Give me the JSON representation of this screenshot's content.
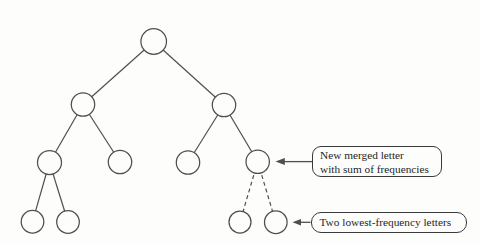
{
  "figure": {
    "background": "#fdfdfc",
    "line_color": "#4f4f4f",
    "node_fill": "#fdfdfc",
    "box_border_color": "#3a3a3a",
    "text_color": "#1f1f1f"
  },
  "tree": {
    "type": "binary-tree",
    "levels": 4,
    "node_count": 11,
    "nodes": [
      {
        "id": "root",
        "level": 0
      },
      {
        "id": "left",
        "level": 1,
        "parent": "root",
        "edge": "solid"
      },
      {
        "id": "right",
        "level": 1,
        "parent": "root",
        "edge": "solid"
      },
      {
        "id": "left-left",
        "level": 2,
        "parent": "left",
        "edge": "solid"
      },
      {
        "id": "left-right",
        "level": 2,
        "parent": "left",
        "edge": "solid"
      },
      {
        "id": "right-left",
        "level": 2,
        "parent": "right",
        "edge": "solid"
      },
      {
        "id": "merged",
        "level": 2,
        "parent": "right",
        "edge": "solid"
      },
      {
        "id": "left-left-a",
        "level": 3,
        "parent": "left-left",
        "edge": "solid"
      },
      {
        "id": "left-left-b",
        "level": 3,
        "parent": "left-left",
        "edge": "solid"
      },
      {
        "id": "lowest-a",
        "level": 3,
        "parent": "merged",
        "edge": "dashed"
      },
      {
        "id": "lowest-b",
        "level": 3,
        "parent": "merged",
        "edge": "dashed"
      }
    ]
  },
  "annotations": [
    {
      "id": "merged-letter-callout",
      "lines": [
        "New merged letter",
        "with sum of frequencies"
      ],
      "points_to": "merged"
    },
    {
      "id": "lowest-frequency-callout",
      "lines": [
        "Two lowest-frequency letters"
      ],
      "points_to": "lowest-b"
    }
  ]
}
